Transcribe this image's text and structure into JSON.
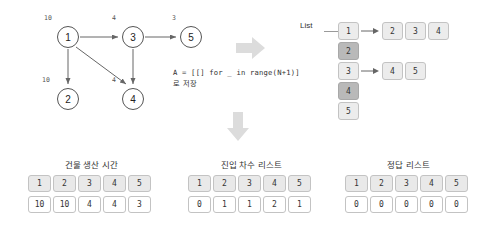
{
  "graph": {
    "nodes": [
      {
        "id": "1",
        "weight": "10",
        "x": 57,
        "y": 26,
        "lx": 44,
        "ly": 14
      },
      {
        "id": "3",
        "weight": "4",
        "x": 122,
        "y": 26,
        "lx": 112,
        "ly": 14
      },
      {
        "id": "5",
        "weight": "3",
        "x": 180,
        "y": 26,
        "lx": 172,
        "ly": 14
      },
      {
        "id": "2",
        "weight": "10",
        "x": 57,
        "y": 88,
        "lx": 42,
        "ly": 76
      },
      {
        "id": "4",
        "weight": "4",
        "x": 122,
        "y": 88,
        "lx": 112,
        "ly": 76
      }
    ],
    "edges": [
      {
        "from": "1",
        "to": "3"
      },
      {
        "from": "3",
        "to": "5"
      },
      {
        "from": "1",
        "to": "2"
      },
      {
        "from": "1",
        "to": "4"
      },
      {
        "from": "3",
        "to": "4"
      }
    ]
  },
  "code": {
    "line": "A = [[] for _ in range(N+1)]",
    "note": "로 저장"
  },
  "adjacency": {
    "label": "List",
    "rows": [
      {
        "key": "1",
        "shaded": false,
        "values": [
          "2",
          "3",
          "4"
        ]
      },
      {
        "key": "2",
        "shaded": true,
        "values": []
      },
      {
        "key": "3",
        "shaded": false,
        "values": [
          "4",
          "5"
        ]
      },
      {
        "key": "4",
        "shaded": true,
        "values": []
      },
      {
        "key": "5",
        "shaded": false,
        "values": []
      }
    ]
  },
  "tables": [
    {
      "caption": "건물 생산 시간",
      "headers": [
        "1",
        "2",
        "3",
        "4",
        "5"
      ],
      "values": [
        "10",
        "10",
        "4",
        "4",
        "3"
      ],
      "x": 28,
      "y": 158,
      "w": 127
    },
    {
      "caption": "진입 차수 리스트",
      "headers": [
        "1",
        "2",
        "3",
        "4",
        "5"
      ],
      "values": [
        "0",
        "1",
        "1",
        "2",
        "1"
      ],
      "x": 188,
      "y": 158,
      "w": 127
    },
    {
      "caption": "정답 리스트",
      "headers": [
        "1",
        "2",
        "3",
        "4",
        "5"
      ],
      "values": [
        "0",
        "0",
        "0",
        "0",
        "0"
      ],
      "x": 345,
      "y": 158,
      "w": 127
    }
  ],
  "flow_arrows": [
    {
      "name": "flow-arrow-right",
      "dir": "right",
      "x": 236,
      "y": 37
    },
    {
      "name": "flow-arrow-down",
      "dir": "down",
      "x": 227,
      "y": 112
    }
  ],
  "colors": {
    "cell_light": "#ececec",
    "cell_dark": "#b9b9b9",
    "border": "#c3c3c3",
    "stroke": "#555555",
    "arrow_gray": "#dcdcdc",
    "background": "#ffffff"
  }
}
